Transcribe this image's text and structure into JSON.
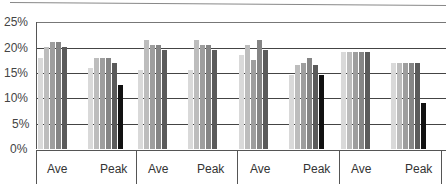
{
  "chart_data": {
    "type": "bar",
    "title": "",
    "xlabel": "",
    "ylabel": "",
    "ylim": [
      0,
      25
    ],
    "yticks": [
      "0%",
      "5%",
      "10%",
      "15%",
      "20%",
      "25%"
    ],
    "grid": true,
    "legend": null,
    "groups": [
      {
        "id": "group-1",
        "categories": [
          {
            "label": "Ave",
            "values": [
              18,
              20,
              21,
              21,
              20
            ]
          },
          {
            "label": "Peak",
            "values": [
              16,
              18,
              18,
              18,
              17,
              12.5
            ]
          }
        ]
      },
      {
        "id": "group-2",
        "categories": [
          {
            "label": "Ave",
            "values": [
              15.5,
              21.5,
              20.5,
              20.5,
              19.5
            ]
          },
          {
            "label": "Peak",
            "values": [
              15.5,
              21.5,
              20.5,
              20.5,
              19.5
            ]
          }
        ]
      },
      {
        "id": "group-3",
        "categories": [
          {
            "label": "Ave",
            "values": [
              18.5,
              20.5,
              17.5,
              21.5,
              19.5
            ]
          },
          {
            "label": "Peak",
            "values": [
              14.5,
              16.5,
              17,
              18,
              16.5,
              14.5
            ]
          }
        ]
      },
      {
        "id": "group-4",
        "categories": [
          {
            "label": "Ave",
            "values": [
              19,
              19,
              19,
              19,
              19
            ]
          },
          {
            "label": "Peak",
            "values": [
              17,
              17,
              17,
              17,
              17,
              9
            ]
          }
        ]
      }
    ],
    "series_colors": [
      "#d9d9d9",
      "#bdbdbd",
      "#9e9e9e",
      "#858585",
      "#5a5a5a",
      "#111111"
    ]
  },
  "axis": {
    "y_labels": [
      "25%",
      "20%",
      "15%",
      "10%",
      "5%",
      "0%"
    ],
    "x_labels": [
      "Ave",
      "Peak",
      "Ave",
      "Peak",
      "Ave",
      "Peak",
      "Ave",
      "Peak"
    ]
  }
}
